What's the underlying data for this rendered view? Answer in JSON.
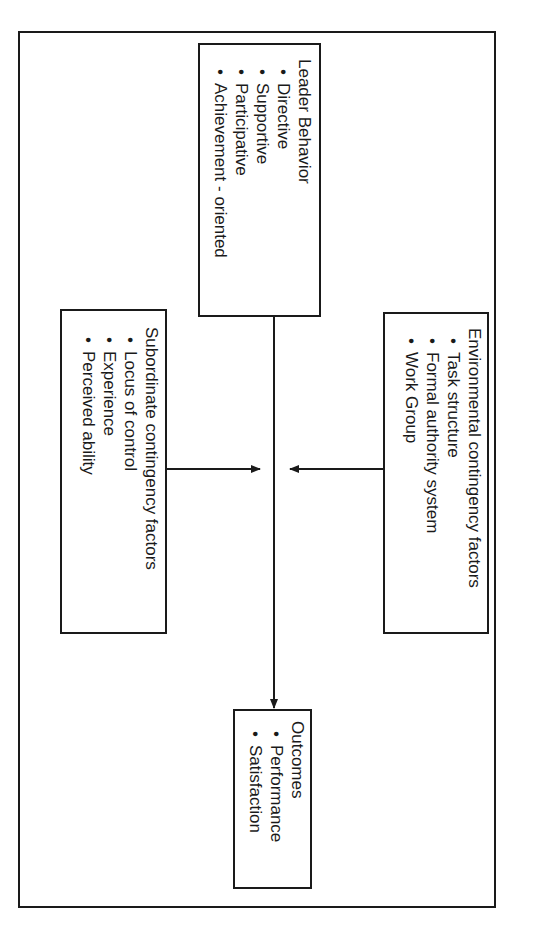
{
  "diagram": {
    "orientation": "rotated-90-clockwise",
    "line_color": "#1a1a1a",
    "background": "#ffffff",
    "boxes": {
      "leader_behavior": {
        "title": "Leader Behavior",
        "items": [
          "Directive",
          "Supportive",
          "Participative",
          "Achievement - oriented"
        ]
      },
      "environmental": {
        "title": "Environmental contingency factors",
        "items": [
          "Task structure",
          "Formal authority system",
          "Work Group"
        ]
      },
      "subordinate": {
        "title": "Subordinate contingency factors",
        "items": [
          "Locus of control",
          "Experience",
          "Perceived ability"
        ]
      },
      "outcomes": {
        "title": "Outcomes",
        "items": [
          "Performance",
          "Satisfaction"
        ]
      }
    },
    "connections": [
      {
        "from": "leader_behavior",
        "to": "outcomes",
        "type": "arrow"
      },
      {
        "from": "environmental",
        "to": "leader_behavior-outcomes-line",
        "type": "arrow"
      },
      {
        "from": "subordinate",
        "to": "leader_behavior-outcomes-line",
        "type": "arrow"
      }
    ]
  }
}
